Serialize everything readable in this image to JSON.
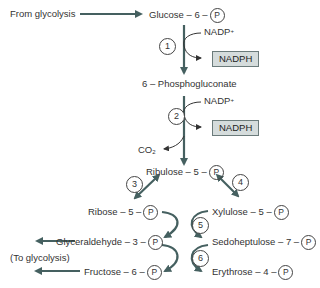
{
  "diagram": {
    "colors": {
      "arrow": "#456060",
      "box_fill": "#d5dcdc",
      "text": "#333333"
    },
    "nodes": {
      "from_glycolysis": "From glycolysis",
      "glucose6p": {
        "text": "Glucose – 6 –",
        "p": "P"
      },
      "phosphogluconate": "6 – Phosphogluconate",
      "ribulose5p": {
        "text": "Ribulose – 5 –",
        "p": "P"
      },
      "ribose5p": {
        "text": "Ribose – 5 –",
        "p": "P"
      },
      "xylulose5p": {
        "text": "Xylulose – 5 –",
        "p": "P"
      },
      "glyceraldehyde3p": {
        "text": "Glyceraldehyde – 3 –",
        "p": "P"
      },
      "sedoheptulose7p": {
        "text": "Sedoheptulose – 7 –",
        "p": "P"
      },
      "fructose6p": {
        "text": "Fructose – 6 –",
        "p": "P"
      },
      "erythrose4p": {
        "text": "Erythrose – 4 –",
        "p": "P"
      },
      "to_glycolysis": "(To glycolysis)"
    },
    "cofactors": {
      "nadp1": "NADP",
      "nadp1_sup": "+",
      "nadph1": "NADPH",
      "nadp2": "NADP",
      "nadp2_sup": "+",
      "nadph2": "NADPH",
      "co2": "CO",
      "co2_sub": "2"
    },
    "steps": [
      "1",
      "2",
      "3",
      "4",
      "5",
      "6"
    ]
  }
}
